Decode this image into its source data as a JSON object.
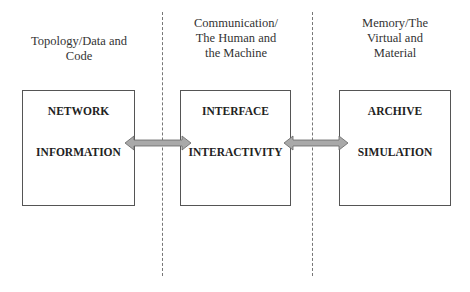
{
  "columns": [
    {
      "heading_lines": [
        "Topology/Data and",
        "Code"
      ],
      "box_top": "NETWORK",
      "box_bottom": "INFORMATION"
    },
    {
      "heading_lines": [
        "Communication/",
        "The Human and",
        "the Machine"
      ],
      "box_top": "INTERFACE",
      "box_bottom": "INTERACTIVITY"
    },
    {
      "heading_lines": [
        "Memory/The",
        "Virtual and",
        "Material"
      ],
      "box_top": "ARCHIVE",
      "box_bottom": "SIMULATION"
    }
  ],
  "arrows": [
    {
      "type": "double-headed",
      "color": "#a9a9a9"
    },
    {
      "type": "double-headed",
      "color": "#a9a9a9"
    }
  ]
}
